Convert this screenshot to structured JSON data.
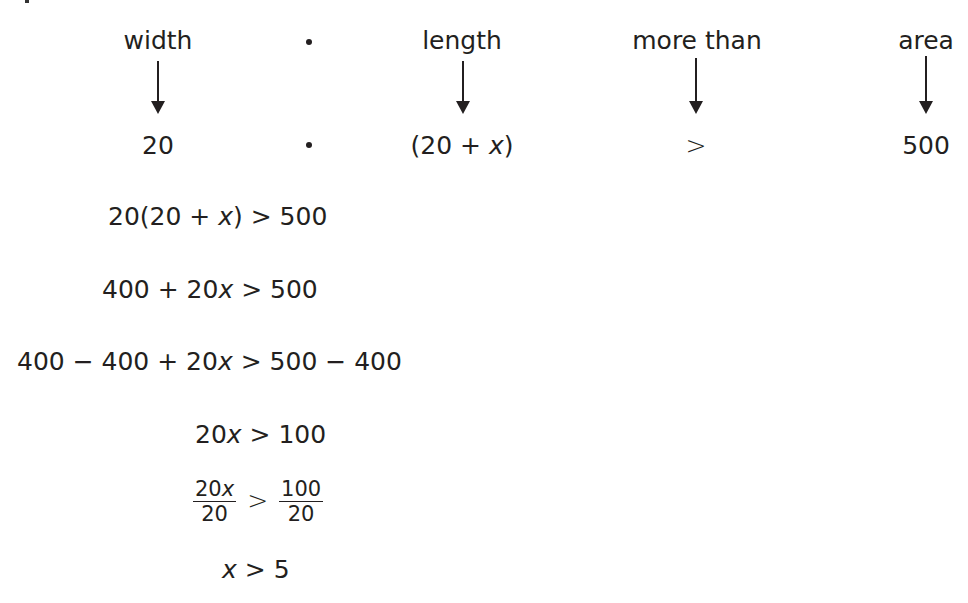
{
  "header_row": {
    "labels": [
      "width",
      "length",
      "more than",
      "area"
    ],
    "values": [
      "20",
      "(20 + ",
      "x",
      ")",
      ">",
      "500"
    ],
    "multiply_symbol": "•"
  },
  "steps": [
    {
      "parts": [
        "20(20 + ",
        "x",
        ") ",
        ">",
        " 500"
      ]
    },
    {
      "parts": [
        "400 + 20",
        "x",
        " ",
        ">",
        " 500"
      ]
    },
    {
      "parts": [
        "400 − 400 + 20",
        "x",
        " ",
        ">",
        " 500 − 400"
      ]
    },
    {
      "parts": [
        "20",
        "x",
        " ",
        ">",
        " 100"
      ]
    },
    {
      "fraction": {
        "left_num": "20",
        "left_num_var": "x",
        "left_den": "20",
        "op": ">",
        "right_num": "100",
        "right_den": "20"
      }
    },
    {
      "parts": [
        "",
        "x",
        " ",
        ">",
        " 5"
      ]
    }
  ],
  "colors": {
    "text": "#231f20",
    "background": "#ffffff"
  },
  "icons": [
    "down-arrow-icon",
    "multiplication-dot-icon"
  ]
}
